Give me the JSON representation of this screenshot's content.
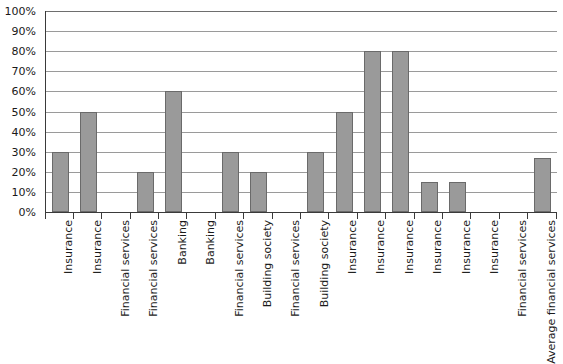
{
  "chart_data": {
    "type": "bar",
    "title": "",
    "subtitle": "",
    "xlabel": "",
    "ylabel": "",
    "ylim": [
      0,
      100
    ],
    "y_tick_labels": [
      "0%",
      "10%",
      "20%",
      "30%",
      "40%",
      "50%",
      "60%",
      "70%",
      "80%",
      "90%",
      "100%"
    ],
    "y_tick_values": [
      0,
      10,
      20,
      30,
      40,
      50,
      60,
      70,
      80,
      90,
      100
    ],
    "grid": true,
    "legend": "none",
    "bar_color": "#9a9a9a",
    "bar_border_color": "#6a6a6a",
    "axis_color": "#3a3a3a",
    "gridline_color": "#9a9a9a",
    "categories": [
      "Insurance",
      "Insurance",
      "Financial services",
      "Financial services",
      "Banking",
      "Banking",
      "Financial services",
      "Building society",
      "Financial services",
      "Building society",
      "Insurance",
      "Insurance",
      "Insurance",
      "Insurance",
      "Insurance",
      "Insurance",
      "Financial services",
      "Average financial services"
    ],
    "values": [
      30,
      50,
      0,
      20,
      60,
      0,
      30,
      20,
      0,
      30,
      50,
      80,
      80,
      15,
      15,
      0,
      0,
      27
    ],
    "value_labels": [
      "30%",
      "50%",
      "0%",
      "20%",
      "60%",
      "0%",
      "30%",
      "20%",
      "0%",
      "30%",
      "50%",
      "80%",
      "80%",
      "15%",
      "15%",
      "0%",
      "0%",
      "27%"
    ]
  }
}
